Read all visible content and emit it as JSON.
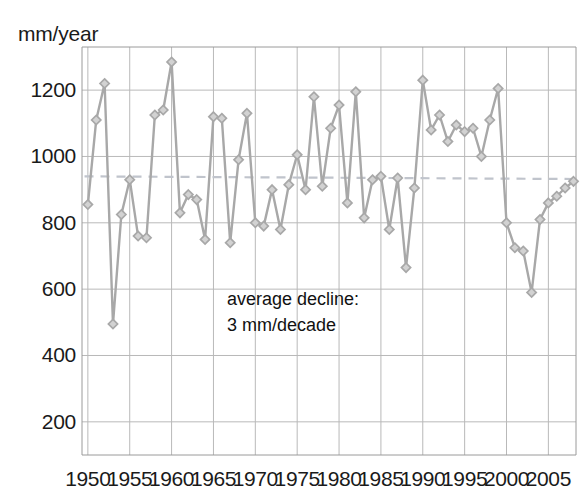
{
  "chart_data": {
    "type": "line",
    "title": "",
    "subtitle": "",
    "xlabel": "",
    "ylabel": "mm/year",
    "ylabel_position": "top-left",
    "xlim": [
      1949.3,
      2008.3
    ],
    "ylim": [
      100,
      1330
    ],
    "ytick_values": [
      200,
      400,
      600,
      800,
      1000,
      1200
    ],
    "ytick_labels": [
      "200",
      "400",
      "600",
      "800",
      "1000",
      "1200"
    ],
    "xtick_values": [
      1950,
      1955,
      1960,
      1965,
      1970,
      1975,
      1980,
      1985,
      1990,
      1995,
      2000,
      2005
    ],
    "xtick_labels": [
      "1950",
      "1955",
      "1960",
      "1965",
      "1970",
      "1975",
      "1980",
      "1985",
      "1990",
      "1995",
      "2000",
      "2005"
    ],
    "grid": true,
    "grid_color": "#b9b9b9",
    "legend": false,
    "legend_position": "none",
    "series": [
      {
        "name": "annual precipitation",
        "marker": "diamond",
        "color": "#a8a8a8",
        "line_color": "#a8a8a8",
        "x": [
          1950,
          1951,
          1952,
          1953,
          1954,
          1955,
          1956,
          1957,
          1958,
          1959,
          1960,
          1961,
          1962,
          1963,
          1964,
          1965,
          1966,
          1967,
          1968,
          1969,
          1970,
          1971,
          1972,
          1973,
          1974,
          1975,
          1976,
          1977,
          1978,
          1979,
          1980,
          1981,
          1982,
          1983,
          1984,
          1985,
          1986,
          1987,
          1988,
          1989,
          1990,
          1991,
          1992,
          1993,
          1994,
          1995,
          1996,
          1997,
          1998,
          1999,
          2000,
          2001,
          2002,
          2003,
          2004,
          2005,
          2006,
          2007,
          2008
        ],
        "y": [
          855,
          1110,
          1220,
          495,
          825,
          930,
          760,
          755,
          1125,
          1140,
          1285,
          830,
          885,
          870,
          750,
          1120,
          1115,
          740,
          990,
          1130,
          800,
          790,
          900,
          780,
          915,
          1005,
          900,
          1180,
          910,
          1085,
          1155,
          860,
          1195,
          815,
          930,
          940,
          780,
          935,
          665,
          905,
          1230,
          1080,
          1125,
          1045,
          1095,
          1075,
          1085,
          1000,
          1110,
          1205,
          800,
          725,
          715,
          590,
          810,
          860,
          880,
          905,
          925
        ]
      }
    ],
    "trend_line": {
      "name": "average trend",
      "style": "dashed",
      "color": "#c0c4cc",
      "x": [
        1949.6,
        2008.2
      ],
      "y": [
        940,
        932
      ]
    },
    "annotations": [
      {
        "text_line1": "average decline:",
        "text_line2": "3 mm/decade",
        "x": 1974.5,
        "y": 530
      }
    ]
  }
}
